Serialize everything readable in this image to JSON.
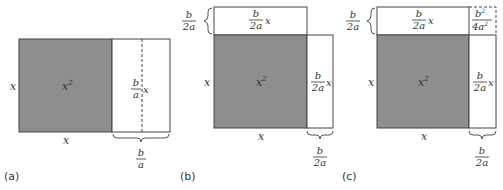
{
  "colors": {
    "gray": "#8e8e8e",
    "stroke": "#444444",
    "text": "#333333"
  },
  "panels": [
    {
      "id": "a",
      "label": "(a)",
      "square_label": "x",
      "square_sup": "2",
      "left_side": "x",
      "bottom_side": "x",
      "right_rect": {
        "num": "b",
        "den": "a",
        "suffix": "x"
      },
      "brace_label": {
        "num": "b",
        "den": "a"
      }
    },
    {
      "id": "b",
      "label": "(b)",
      "square_label": "x",
      "square_sup": "2",
      "left_side": "x",
      "bottom_side": "x",
      "top_rect": {
        "num": "b",
        "den": "2a",
        "suffix": "x"
      },
      "top_brace": {
        "num": "b",
        "den": "2a"
      },
      "right_rect": {
        "num": "b",
        "den": "2a",
        "suffix": "x"
      },
      "brace_label": {
        "num": "b",
        "den": "2a"
      }
    },
    {
      "id": "c",
      "label": "(c)",
      "square_label": "x",
      "square_sup": "2",
      "left_side": "x",
      "bottom_side": "x",
      "top_rect": {
        "num": "b",
        "den": "2a",
        "suffix": "x"
      },
      "top_brace": {
        "num": "b",
        "den": "2a"
      },
      "corner": {
        "num": "b",
        "num_sup": "2",
        "den": "4a",
        "den_sup": "2"
      },
      "right_rect": {
        "num": "b",
        "den": "2a",
        "suffix": "x"
      },
      "brace_label": {
        "num": "b",
        "den": "2a"
      }
    }
  ]
}
